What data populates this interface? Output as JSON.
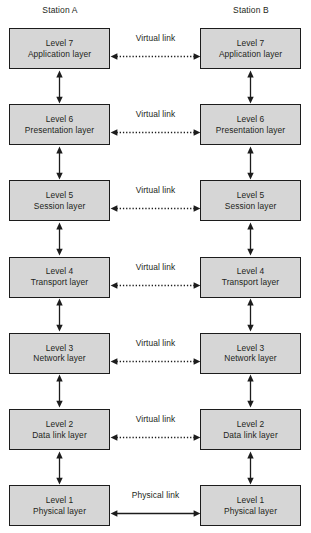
{
  "stations": {
    "left_label": "Station A",
    "right_label": "Station B"
  },
  "colors": {
    "box_fill": "#d6d6d6",
    "box_border": "#1c1c1c",
    "text": "#231f20",
    "background": "#ffffff"
  },
  "layers": [
    {
      "level": "Level 7",
      "name": "Application layer",
      "link_label": "Virtual link",
      "link_style": "dotted",
      "link_arrows": "both"
    },
    {
      "level": "Level 6",
      "name": "Presentation layer",
      "link_label": "Virtual link",
      "link_style": "dotted",
      "link_arrows": "both"
    },
    {
      "level": "Level 5",
      "name": "Session layer",
      "link_label": "Virtual link",
      "link_style": "dotted",
      "link_arrows": "both"
    },
    {
      "level": "Level 4",
      "name": "Transport layer",
      "link_label": "Virtual link",
      "link_style": "dotted",
      "link_arrows": "both"
    },
    {
      "level": "Level 3",
      "name": "Network layer",
      "link_label": "Virtual link",
      "link_style": "dotted",
      "link_arrows": "both"
    },
    {
      "level": "Level 2",
      "name": "Data link layer",
      "link_label": "Virtual link",
      "link_style": "dotted",
      "link_arrows": "both"
    },
    {
      "level": "Level 1",
      "name": "Physical layer",
      "link_label": "Physical link",
      "link_style": "solid",
      "link_arrows": "both"
    }
  ],
  "vertical_connectors": {
    "style": "solid",
    "arrows": "both",
    "count_per_station": 6
  }
}
